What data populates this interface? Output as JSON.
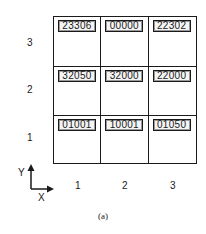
{
  "figure": {
    "caption": "(a)",
    "axes": {
      "x_label": "X",
      "y_label": "Y"
    },
    "row_labels": [
      "3",
      "2",
      "1"
    ],
    "col_labels": [
      "1",
      "2",
      "3"
    ],
    "grid": [
      [
        {
          "row": 3,
          "col": 1,
          "code": "23306"
        },
        {
          "row": 3,
          "col": 2,
          "code": "00000"
        },
        {
          "row": 3,
          "col": 3,
          "code": "22302"
        }
      ],
      [
        {
          "row": 2,
          "col": 1,
          "code": "32050"
        },
        {
          "row": 2,
          "col": 2,
          "code": "32000"
        },
        {
          "row": 2,
          "col": 3,
          "code": "22000"
        }
      ],
      [
        {
          "row": 1,
          "col": 1,
          "code": "01001"
        },
        {
          "row": 1,
          "col": 2,
          "code": "10001"
        },
        {
          "row": 1,
          "col": 3,
          "code": "01050"
        }
      ]
    ],
    "colors": {
      "ink": "#1a1a1a",
      "box_fill": "#f4f4f4",
      "background": "#ffffff"
    }
  }
}
